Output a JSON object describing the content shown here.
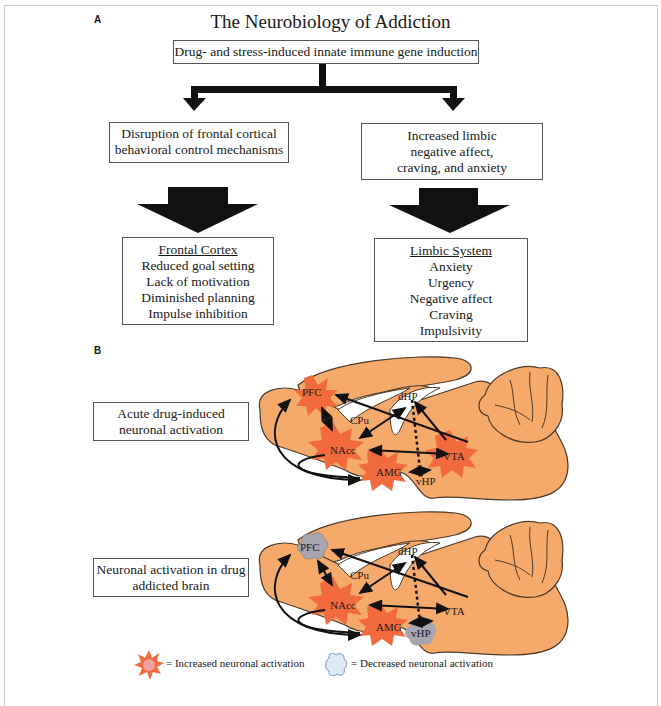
{
  "panel_a": {
    "label": "A",
    "title": "The Neurobiology of Addiction",
    "root_box": "Drug- and stress-induced innate immune gene induction",
    "left_branch": {
      "box_lines": [
        "Disruption of frontal cortical",
        "behavioral control mechanisms"
      ],
      "detail": {
        "header": "Frontal Cortex",
        "items": [
          "Reduced goal setting",
          "Lack of motivation",
          "Diminished planning",
          "Impulse inhibition"
        ]
      }
    },
    "right_branch": {
      "box_lines": [
        "Increased limbic",
        "negative affect,",
        "craving, and anxiety"
      ],
      "detail": {
        "header": "Limbic System",
        "items": [
          "Anxiety",
          "Urgency",
          "Negative affect",
          "Craving",
          "Impulsivity"
        ]
      }
    }
  },
  "panel_b": {
    "label": "B",
    "diagrams": [
      {
        "caption_lines": [
          "Acute drug-induced",
          "neuronal activation"
        ],
        "regions": {
          "pfc": "PFC",
          "cpu": "CPu",
          "dhp": "dHP",
          "nacc": "NAcc",
          "amg": "AMG",
          "vta": "VTA",
          "vhp": "vHP"
        },
        "states": {
          "pfc": "increased",
          "nacc": "increased",
          "amg": "increased",
          "vta": "increased",
          "vhp": "none"
        }
      },
      {
        "caption_lines": [
          "Neuronal activation in drug",
          "addicted brain"
        ],
        "regions": {
          "pfc": "PFC",
          "cpu": "CPu",
          "dhp": "dHP",
          "nacc": "NAcc",
          "amg": "AMG",
          "vta": "VTA",
          "vhp": "vHP"
        },
        "states": {
          "pfc": "decreased",
          "nacc": "increased",
          "amg": "increased",
          "vta": "none",
          "vhp": "decreased"
        }
      }
    ],
    "legend": {
      "increased": "= Increased neuronal activation",
      "decreased": "= Decreased neuronal activation"
    }
  },
  "colors": {
    "brain_fill": "#F5A96A",
    "brain_stroke": "#4a3a2a",
    "starburst": "#F26A3E",
    "decreased_cloud": "#A8A4B0",
    "legend_cloud": "#DCEBF7",
    "arrow": "#111111"
  }
}
